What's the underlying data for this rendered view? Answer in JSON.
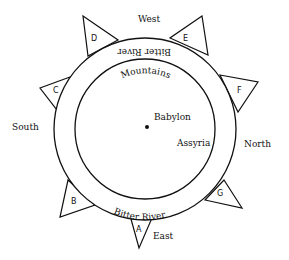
{
  "diagram": {
    "center": {
      "label": "Babylon"
    },
    "places": [
      {
        "label": "Assyria"
      }
    ],
    "rings": {
      "inner_label": "Mountains",
      "outer_label_top": "Bitter River",
      "outer_label_bottom": "Bitter River"
    },
    "directions": {
      "west": "West",
      "east": "East",
      "north": "North",
      "south": "South"
    },
    "regions": [
      "A",
      "B",
      "C",
      "D",
      "E",
      "F",
      "G"
    ]
  }
}
